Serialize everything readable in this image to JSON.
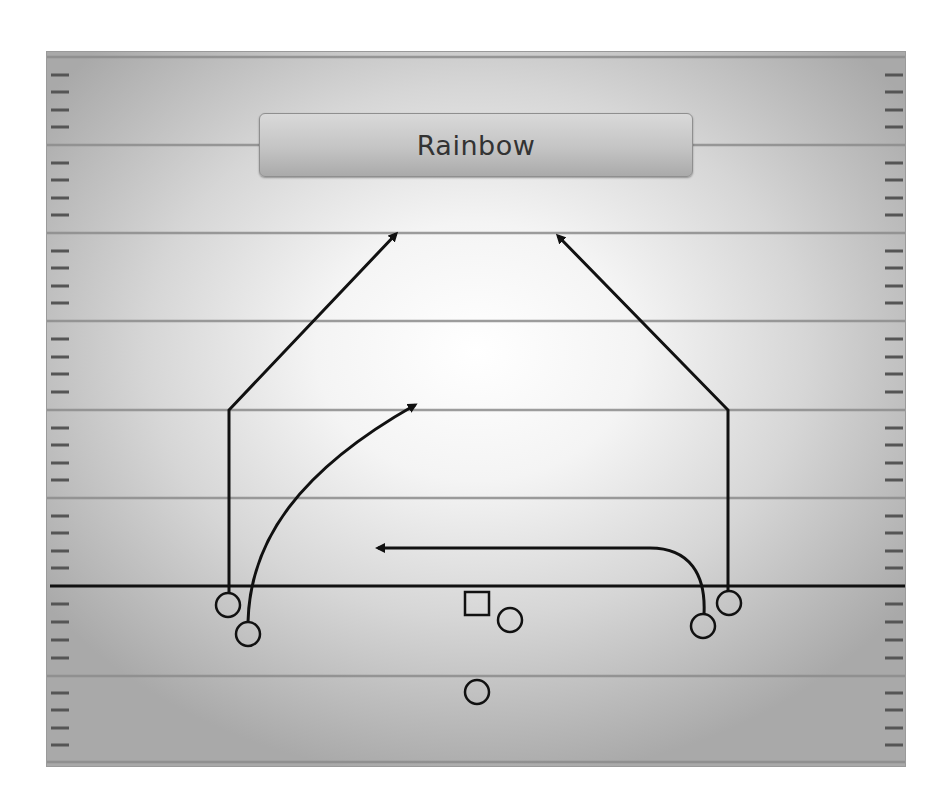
{
  "play": {
    "title": "Rainbow"
  },
  "colors": {
    "field_center": "#ffffff",
    "field_edge": "#a9a9a9",
    "yard_line": "#8c8c8c",
    "hash_mark": "#555555",
    "line_of_scrimmage": "#111111",
    "route": "#111111",
    "player_stroke": "#111111",
    "title_box_top": "#d9d9d9",
    "title_box_bottom": "#aaaaaa",
    "title_text": "#333333"
  },
  "field": {
    "yard_lines_y": [
      57,
      145,
      233,
      321,
      410,
      498,
      676,
      762
    ],
    "line_of_scrimmage_y": 586
  },
  "players": [
    {
      "id": "left-wide-receiver",
      "shape": "circle",
      "cx": 228,
      "cy": 605
    },
    {
      "id": "left-slot-receiver",
      "shape": "circle",
      "cx": 248,
      "cy": 634
    },
    {
      "id": "center",
      "shape": "square",
      "cx": 477,
      "cy": 604
    },
    {
      "id": "quarterback-side-back",
      "shape": "circle",
      "cx": 510,
      "cy": 620
    },
    {
      "id": "running-back",
      "shape": "circle",
      "cx": 477,
      "cy": 692
    },
    {
      "id": "right-slot-receiver",
      "shape": "circle",
      "cx": 703,
      "cy": 626
    },
    {
      "id": "right-wide-receiver",
      "shape": "circle",
      "cx": 729,
      "cy": 603
    }
  ],
  "routes": [
    {
      "id": "left-post-route",
      "player": "left-wide-receiver",
      "type": "post",
      "break_point": [
        229,
        410
      ],
      "end": [
        401,
        229
      ]
    },
    {
      "id": "left-slot-corner-route",
      "player": "left-slot-receiver",
      "type": "curved-seam",
      "end": [
        420,
        402
      ]
    },
    {
      "id": "right-slot-drag-route",
      "player": "right-slot-receiver",
      "type": "drag",
      "end": [
        371,
        548
      ]
    },
    {
      "id": "right-post-route",
      "player": "right-wide-receiver",
      "type": "post",
      "break_point": [
        728,
        410
      ],
      "end": [
        553,
        231
      ]
    }
  ]
}
